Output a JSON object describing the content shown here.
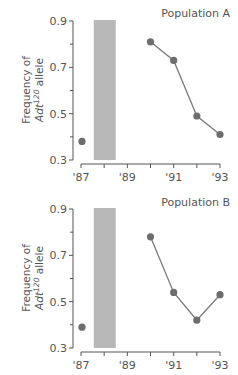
{
  "chart_data": [
    {
      "type": "line",
      "title": "Population A",
      "xlabel": "",
      "ylabel": "Frequency of",
      "ylabel_line2_prefix": "Adt",
      "ylabel_line2_superscript": "120",
      "ylabel_line2_suffix": " allele",
      "ylim": [
        0.3,
        0.9
      ],
      "xlim": [
        1987,
        1993
      ],
      "yticks": [
        0.3,
        0.5,
        0.7,
        0.9
      ],
      "yticks_minor": [
        0.4,
        0.6,
        0.8
      ],
      "ytick_labels": [
        "0.3",
        "0.5",
        "0.7",
        "0.9"
      ],
      "xticks": [
        1987,
        1988,
        1989,
        1990,
        1991,
        1992,
        1993
      ],
      "xtick_labels": [
        {
          "x": 1987,
          "label": "'87"
        },
        {
          "x": 1989,
          "label": "'89"
        },
        {
          "x": 1991,
          "label": "'91"
        },
        {
          "x": 1993,
          "label": "'93"
        }
      ],
      "shaded_interval": [
        1987.55,
        1988.5
      ],
      "isolated_point": {
        "x": 1987,
        "y": 0.38
      },
      "series": [
        {
          "name": "Population A",
          "x": [
            1990,
            1991,
            1992,
            1993
          ],
          "values": [
            0.81,
            0.73,
            0.49,
            0.41
          ]
        }
      ]
    },
    {
      "type": "line",
      "title": "Population B",
      "xlabel": "",
      "ylabel": "Frequency of",
      "ylabel_line2_prefix": "Adt",
      "ylabel_line2_superscript": "120",
      "ylabel_line2_suffix": " allele",
      "ylim": [
        0.3,
        0.9
      ],
      "xlim": [
        1987,
        1993
      ],
      "yticks": [
        0.3,
        0.5,
        0.7,
        0.9
      ],
      "yticks_minor": [
        0.4,
        0.6,
        0.8
      ],
      "ytick_labels": [
        "0.3",
        "0.5",
        "0.7",
        "0.9"
      ],
      "xticks": [
        1987,
        1988,
        1989,
        1990,
        1991,
        1992,
        1993
      ],
      "xtick_labels": [
        {
          "x": 1987,
          "label": "'87"
        },
        {
          "x": 1989,
          "label": "'89"
        },
        {
          "x": 1991,
          "label": "'91"
        },
        {
          "x": 1993,
          "label": "'93"
        }
      ],
      "shaded_interval": [
        1987.55,
        1988.5
      ],
      "isolated_point": {
        "x": 1987,
        "y": 0.39
      },
      "series": [
        {
          "name": "Population B",
          "x": [
            1990,
            1991,
            1992,
            1993
          ],
          "values": [
            0.78,
            0.54,
            0.42,
            0.53
          ]
        }
      ]
    }
  ]
}
